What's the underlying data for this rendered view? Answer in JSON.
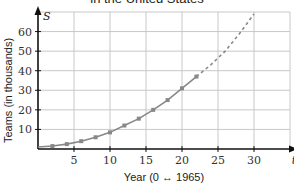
{
  "chart_data": {
    "type": "line",
    "title": "in the United States",
    "xlabel": "Year (0 ↔ 1965)",
    "ylabel": "Teams (in thousands)",
    "x_var": "t",
    "y_var": "S",
    "xlim": [
      0,
      35
    ],
    "ylim": [
      0,
      70
    ],
    "x_ticks": [
      5,
      10,
      15,
      20,
      25,
      30
    ],
    "y_ticks": [
      10,
      20,
      30,
      40,
      50,
      60
    ],
    "grid": true,
    "series": [
      {
        "name": "observed",
        "style": "solid-with-markers",
        "x": [
          0,
          2,
          4,
          6,
          8,
          10,
          12,
          14,
          16,
          18,
          20,
          22
        ],
        "values": [
          1,
          1.5,
          2.5,
          4,
          6,
          8.5,
          12,
          15.5,
          20,
          25,
          31,
          37
        ]
      },
      {
        "name": "extrapolated",
        "style": "dashed",
        "x": [
          22,
          24,
          26,
          28,
          30
        ],
        "values": [
          37,
          43,
          50,
          59,
          69
        ]
      }
    ],
    "color": "#888888"
  }
}
